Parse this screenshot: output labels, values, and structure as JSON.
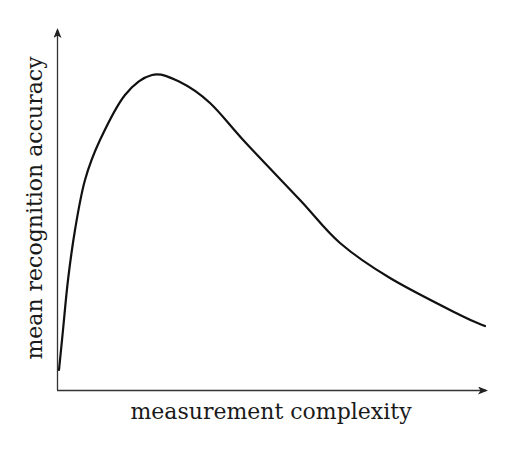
{
  "chart_data": {
    "type": "line",
    "title": "",
    "xlabel": "measurement complexity",
    "ylabel": "mean recognition accuracy",
    "grid": false,
    "legend": null,
    "ticks": {
      "x": [],
      "y": []
    },
    "series": [
      {
        "name": "accuracy vs complexity",
        "description": "rises steeply from near zero, peaks at low-moderate complexity, then decays slowly",
        "x": [
          0.0,
          0.01,
          0.02,
          0.04,
          0.06,
          0.1,
          0.16,
          0.22,
          0.29,
          0.35,
          0.43,
          0.56,
          0.66,
          0.78,
          0.94,
          1.0
        ],
        "y": [
          0.0,
          0.13,
          0.29,
          0.45,
          0.61,
          0.74,
          0.88,
          0.95,
          0.93,
          0.86,
          0.73,
          0.53,
          0.39,
          0.28,
          0.17,
          0.14
        ]
      }
    ],
    "xlim": [
      0,
      1
    ],
    "ylim": [
      0,
      1
    ],
    "annotations": []
  },
  "plot": {
    "pixel_path": [
      [
        59,
        370
      ],
      [
        63,
        330
      ],
      [
        68,
        280
      ],
      [
        75,
        230
      ],
      [
        85,
        180
      ],
      [
        100,
        140
      ],
      [
        125,
        95
      ],
      [
        152,
        75
      ],
      [
        180,
        82
      ],
      [
        210,
        103
      ],
      [
        245,
        142
      ],
      [
        300,
        200
      ],
      [
        340,
        243
      ],
      [
        390,
        278
      ],
      [
        460,
        315
      ],
      [
        485,
        326
      ]
    ],
    "colors": {
      "axis": "#333333",
      "curve": "#111111",
      "text": "#1a1a1a",
      "background": "#ffffff"
    }
  }
}
